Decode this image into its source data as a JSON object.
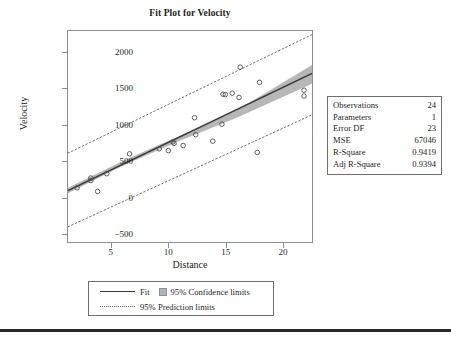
{
  "chart_data": {
    "type": "scatter",
    "title": "Fit Plot for Velocity",
    "xlabel": "Distance",
    "ylabel": "Velocity",
    "xlim": [
      1.2,
      22.6
    ],
    "ylim": [
      -620,
      2300
    ],
    "xticks": [
      5,
      10,
      15,
      20
    ],
    "yticks": [
      2000,
      1500,
      1000,
      500,
      0,
      -500
    ],
    "ytick_labels": [
      "2000",
      "1500",
      "1000",
      "500",
      "0",
      "−500"
    ],
    "xtick_labels": [
      "5",
      "10",
      "15",
      "20"
    ],
    "grid": false,
    "legend_position": "below-axes",
    "series": [
      {
        "name": "Observed data",
        "type": "scatter",
        "marker": "open-circle",
        "x": [
          2.0,
          3.2,
          3.2,
          3.8,
          4.6,
          6.6,
          9.2,
          10.0,
          10.4,
          10.5,
          11.3,
          12.3,
          13.9,
          14.7,
          14.8,
          15.0,
          15.6,
          16.2,
          16.3,
          17.8,
          18.0,
          21.9,
          21.9,
          12.4
        ],
        "y": [
          130,
          265,
          230,
          80,
          325,
          600,
          670,
          645,
          765,
          745,
          715,
          1100,
          775,
          1010,
          1425,
          1420,
          1440,
          1380,
          1800,
          620,
          1590,
          1480,
          1400,
          865
        ]
      },
      {
        "name": "Fit",
        "type": "line",
        "x": [
          1.2,
          22.6
        ],
        "y": [
          92,
          1712
        ],
        "slope": 75.7,
        "intercept": 1.1
      },
      {
        "name": "95% Confidence limits",
        "type": "band",
        "x": [
          1.2,
          6.0,
          11.0,
          16.0,
          22.6
        ],
        "lower": [
          55,
          436,
          780,
          1100,
          1570
        ],
        "upper": [
          130,
          500,
          850,
          1205,
          1830
        ]
      },
      {
        "name": "95% Prediction limits",
        "type": "band-dotted",
        "x": [
          1.2,
          22.6
        ],
        "lower": [
          -410,
          1140
        ],
        "upper": [
          610,
          2250
        ]
      }
    ],
    "colors": {
      "fit_line": "#3c3c3c",
      "confidence_band": "#b3b3b3",
      "prediction_line": "#6d6d6d",
      "marker_edge": "#4d4d4d",
      "frame": "#8d8d8d",
      "text": "#231f20"
    }
  },
  "stats_box": {
    "rows": [
      {
        "label": "Observations",
        "value": "24"
      },
      {
        "label": "Parameters",
        "value": "1"
      },
      {
        "label": "Error DF",
        "value": "23"
      },
      {
        "label": "MSE",
        "value": "67046"
      },
      {
        "label": "R-Square",
        "value": "0.9419"
      },
      {
        "label": "Adj R-Square",
        "value": "0.9394"
      }
    ]
  },
  "legend": {
    "fit_label": "Fit",
    "confidence_label": "95% Confidence limits",
    "prediction_label": "95% Prediction limits"
  }
}
